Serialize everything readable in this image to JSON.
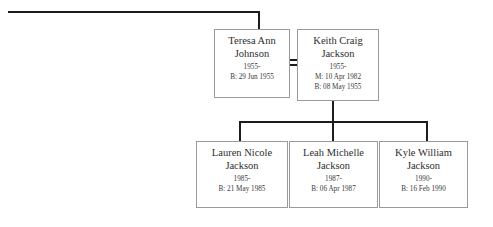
{
  "chart": {
    "type": "genealogy-family-tree",
    "background_color": "#ffffff",
    "line_color": "#1c1c1c",
    "box_border_color": "#9a9a9a",
    "text_color": "#2e2e2e"
  },
  "people": {
    "mother": {
      "name_line1": "Teresa Ann",
      "name_line2": "Johnson",
      "lifespan": "1955-",
      "birth": "B: 29 Jun 1955"
    },
    "father": {
      "name_line1": "Keith Craig",
      "name_line2": "Jackson",
      "lifespan": "1955-",
      "marriage": "M: 10 Apr 1982",
      "birth": "B: 08 May 1955"
    },
    "child1": {
      "name_line1": "Lauren Nicole",
      "name_line2": "Jackson",
      "lifespan": "1985-",
      "birth": "B: 21 May 1985"
    },
    "child2": {
      "name_line1": "Leah Michelle",
      "name_line2": "Jackson",
      "lifespan": "1987-",
      "birth": "B: 06 Apr 1987"
    },
    "child3": {
      "name_line1": "Kyle William",
      "name_line2": "Jackson",
      "lifespan": "1990-",
      "birth": "B: 16 Feb 1990"
    }
  }
}
